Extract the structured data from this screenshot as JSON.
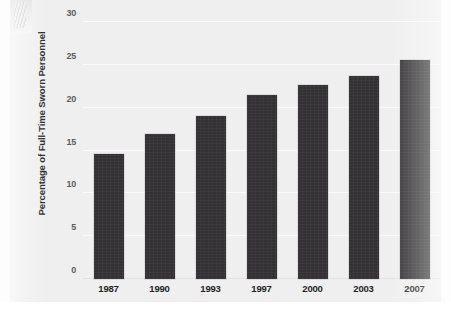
{
  "chart_data": {
    "type": "bar",
    "title": "",
    "xlabel": "",
    "ylabel": "Percentage of Full-Time Sworn Personnel",
    "categories": [
      "1987",
      "1990",
      "1993",
      "1997",
      "2000",
      "2003",
      "2007"
    ],
    "values": [
      14.6,
      16.9,
      19.0,
      21.5,
      22.7,
      23.7,
      25.6
    ],
    "ylim": [
      0,
      30
    ],
    "ytick_labels": [
      "0",
      "5",
      "10",
      "15",
      "20",
      "25",
      "30"
    ],
    "ytick_values": [
      0,
      5,
      10,
      15,
      20,
      25,
      30
    ],
    "grid": true,
    "legend": "none",
    "bar_color": "#333133",
    "plot_background": "#efefef"
  },
  "caption": {
    "partial_text": "Data include black or African American, Hispanic or Latino, Asian, Native Hawaiians or other Pacific Islanders, American India"
  }
}
